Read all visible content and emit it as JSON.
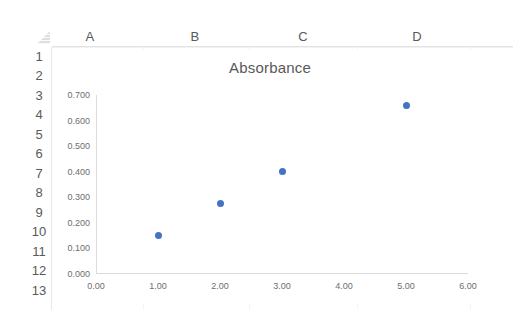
{
  "app": {
    "type": "spreadsheet",
    "select_all_icon": "select-all-corner-icon"
  },
  "grid": {
    "columns": [
      {
        "label": "A",
        "x": 90
      },
      {
        "label": "B",
        "x": 195
      },
      {
        "label": "C",
        "x": 303
      },
      {
        "label": "D",
        "x": 417
      }
    ],
    "rows": [
      {
        "label": "1",
        "y": 57
      },
      {
        "label": "2",
        "y": 76
      },
      {
        "label": "3",
        "y": 96
      },
      {
        "label": "4",
        "y": 115
      },
      {
        "label": "5",
        "y": 135
      },
      {
        "label": "6",
        "y": 154
      },
      {
        "label": "7",
        "y": 174
      },
      {
        "label": "8",
        "y": 193
      },
      {
        "label": "9",
        "y": 213
      },
      {
        "label": "10",
        "y": 232
      },
      {
        "label": "11",
        "y": 252
      },
      {
        "label": "12",
        "y": 271
      },
      {
        "label": "13",
        "y": 291
      }
    ]
  },
  "chart_data": {
    "type": "scatter",
    "title": "Absorbance",
    "xlabel": "",
    "ylabel": "",
    "xlim": [
      0,
      6
    ],
    "ylim": [
      0,
      0.7
    ],
    "grid": false,
    "legend": "none",
    "marker_color": "#4472C4",
    "x_ticks": [
      "0.00",
      "1.00",
      "2.00",
      "3.00",
      "4.00",
      "5.00",
      "6.00"
    ],
    "x_tick_values": [
      0,
      1,
      2,
      3,
      4,
      5,
      6
    ],
    "y_ticks": [
      "0.000",
      "0.100",
      "0.200",
      "0.300",
      "0.400",
      "0.500",
      "0.600",
      "0.700"
    ],
    "y_tick_values": [
      0,
      0.1,
      0.2,
      0.3,
      0.4,
      0.5,
      0.6,
      0.7
    ],
    "series": [
      {
        "name": "Absorbance",
        "x": [
          1,
          2,
          3,
          5
        ],
        "y": [
          0.152,
          0.275,
          0.4,
          0.66
        ]
      }
    ]
  }
}
